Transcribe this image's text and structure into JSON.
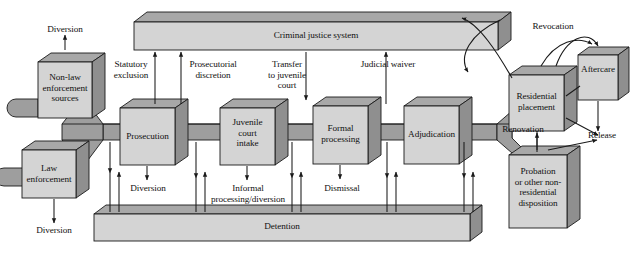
{
  "diagram": {
    "palette": {
      "face": "#d4d4d4",
      "top": "#a8a8a8",
      "side": "#9a9a9a",
      "pipe": "#9e9e9e",
      "stroke": "#1a1a1a",
      "text": "#111111",
      "background": "#ffffff"
    },
    "bars": [
      {
        "id": "criminal-justice-system",
        "label": "Criminal justice system"
      },
      {
        "id": "detention",
        "label": "Detention"
      }
    ],
    "process_boxes": [
      {
        "id": "non-law-enforcement-sources",
        "label": "Non-law\nenforcement\nsources"
      },
      {
        "id": "law-enforcement",
        "label": "Law\nenforcement"
      },
      {
        "id": "prosecution",
        "label": "Prosecution"
      },
      {
        "id": "juvenile-court-intake",
        "label": "Juvenile\ncourt\nintake"
      },
      {
        "id": "formal-processing",
        "label": "Formal\nprocessing"
      },
      {
        "id": "adjudication",
        "label": "Adjudication"
      },
      {
        "id": "residential-placement",
        "label": "Residential\nplacement"
      },
      {
        "id": "aftercare",
        "label": "Aftercare"
      },
      {
        "id": "probation-or-other-nonresidential-disposition",
        "label": "Probation\nor other non-\nresidential\ndisposition"
      }
    ],
    "flow_labels": [
      {
        "id": "diversion-top",
        "label": "Diversion"
      },
      {
        "id": "diversion-law-enforcement",
        "label": "Diversion"
      },
      {
        "id": "diversion-bottom-left",
        "label": "Diversion"
      },
      {
        "id": "statutory-exclusion",
        "label": "Statutory\nexclusion"
      },
      {
        "id": "prosecutorial-discretion",
        "label": "Prosecutorial\ndiscretion"
      },
      {
        "id": "transfer-to-juvenile-court",
        "label": "Transfer\nto juvenile\ncourt"
      },
      {
        "id": "judicial-waiver",
        "label": "Judicial waiver"
      },
      {
        "id": "diversion-prosecution",
        "label": "Diversion"
      },
      {
        "id": "informal-processing-diversion",
        "label": "Informal\nprocessing/diversion"
      },
      {
        "id": "dismissal",
        "label": "Dismissal"
      },
      {
        "id": "revocation-top",
        "label": "Revocation"
      },
      {
        "id": "renovation",
        "label": "Renovation"
      },
      {
        "id": "release",
        "label": "Release"
      }
    ]
  }
}
